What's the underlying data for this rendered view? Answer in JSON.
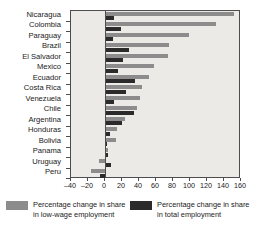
{
  "chart_data": {
    "type": "bar",
    "orientation": "horizontal",
    "title": "",
    "subtitle": "",
    "xlabel": "",
    "ylabel": "",
    "xlim": [
      -40,
      160
    ],
    "xticks": [
      -40,
      -20,
      0,
      20,
      40,
      60,
      80,
      100,
      120,
      140,
      160
    ],
    "xticklabels": [
      "–40",
      "–20",
      "0",
      "20",
      "40",
      "60",
      "80",
      "100",
      "120",
      "140",
      "160"
    ],
    "grid": false,
    "legend_position": "bottom",
    "categories": [
      "Nicaragua",
      "Colombia",
      "Paraguay",
      "Brazil",
      "El Salvador",
      "Mexico",
      "Ecuador",
      "Costa Rica",
      "Venezuela",
      "Chile",
      "Argentina",
      "Honduras",
      "Bolivia",
      "Panama",
      "Uruguay",
      "Peru"
    ],
    "series": [
      {
        "name": "Percentage change in share in low-wage employment",
        "color": "#8c8c8c",
        "values": [
          152,
          130,
          99,
          75,
          74,
          58,
          52,
          44,
          41,
          38,
          24,
          14,
          13,
          4,
          -7,
          -17
        ]
      },
      {
        "name": "Percentage change in share in total employment",
        "color": "#2b2b2b",
        "values": [
          11,
          19,
          9,
          28,
          21,
          15,
          35,
          25,
          11,
          34,
          20,
          6,
          2,
          4,
          7,
          -6
        ]
      }
    ]
  },
  "legend": {
    "items": [
      {
        "swatch": "low-wage-swatch",
        "label": "Percentage change in share in low-wage employment"
      },
      {
        "swatch": "total-employment-swatch",
        "label": "Percentage change in share in total employment"
      }
    ]
  },
  "colors": {
    "low_wage": "#8c8c8c",
    "total_employment": "#2b2b2b",
    "plot_background": "#eceae6",
    "axis": "#4d4d4d",
    "page_background": "#ffffff"
  }
}
